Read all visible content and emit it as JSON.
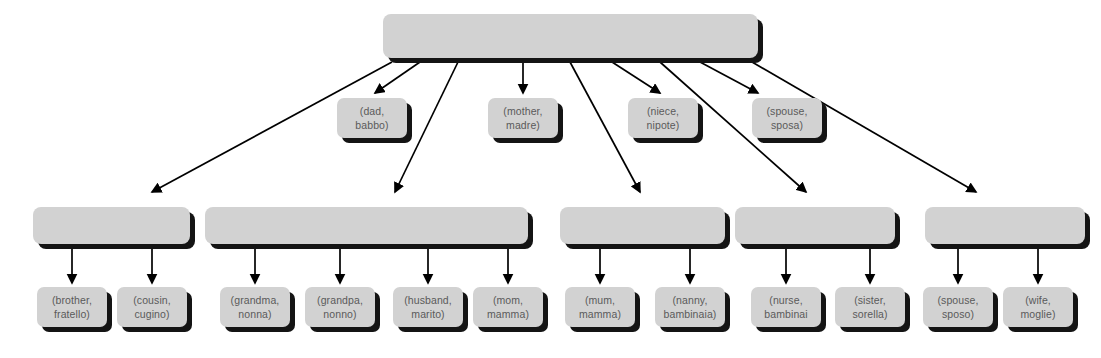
{
  "diagram": {
    "type": "tree",
    "title": "",
    "background_color": "#ffffff",
    "node_fill_color": "#d2d2d2",
    "node_shadow_color": "#141414",
    "text_color": "#5a5a5a",
    "edge_color": "#000000",
    "root": {
      "label": ""
    },
    "groups": [
      {
        "label": ""
      },
      {
        "label": ""
      },
      {
        "label": ""
      },
      {
        "label": ""
      },
      {
        "label": ""
      }
    ],
    "root_leaves": [
      {
        "line1": "(dad,",
        "line2": "babbo)"
      },
      {
        "line1": "(mother,",
        "line2": "madre)"
      },
      {
        "line1": "(niece,",
        "line2": "nipote)"
      },
      {
        "line1": "(spouse,",
        "line2": "sposa)"
      }
    ],
    "group_leaves": [
      [
        {
          "line1": "(brother,",
          "line2": "fratello)"
        },
        {
          "line1": "(cousin,",
          "line2": "cugino)"
        }
      ],
      [
        {
          "line1": "(grandma,",
          "line2": "nonna)"
        },
        {
          "line1": "(grandpa,",
          "line2": "nonno)"
        },
        {
          "line1": "(husband,",
          "line2": "marito)"
        },
        {
          "line1": "(mom,",
          "line2": "mamma)"
        }
      ],
      [
        {
          "line1": "(mum,",
          "line2": "mamma)"
        },
        {
          "line1": "(nanny,",
          "line2": "bambinaia)"
        }
      ],
      [
        {
          "line1": "(nurse,",
          "line2": "bambinai"
        },
        {
          "line1": "(sister,",
          "line2": "sorella)"
        }
      ],
      [
        {
          "line1": "(spouse,",
          "line2": "sposo)"
        },
        {
          "line1": "(wife,",
          "line2": "moglie)"
        }
      ]
    ]
  }
}
